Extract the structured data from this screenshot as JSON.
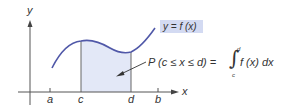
{
  "diagram": {
    "axes": {
      "x_label": "x",
      "y_label": "y"
    },
    "ticks": [
      {
        "label": "a"
      },
      {
        "label": "c"
      },
      {
        "label": "d"
      },
      {
        "label": "b"
      }
    ],
    "curve_label": "y = f (x)",
    "probability_expression": {
      "lhs": "P (c ≤ x ≤ d) =",
      "integral_symbol": "∫",
      "upper_limit": "d",
      "lower_limit": "c",
      "integrand": "f (x) dx"
    },
    "colors": {
      "curve": "#5058a8",
      "shading": "#e3e8f7",
      "label_box": "#d3daf2",
      "axis": "#555555",
      "text": "#333333"
    }
  }
}
